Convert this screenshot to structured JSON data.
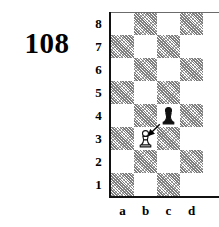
{
  "problem": {
    "number": "108"
  },
  "board": {
    "files": [
      "a",
      "b",
      "c",
      "d"
    ],
    "ranks": [
      "8",
      "7",
      "6",
      "5",
      "4",
      "3",
      "2",
      "1"
    ],
    "light_color": "#ffffff",
    "dark_color": "#8c8c8c",
    "border_color": "#111111",
    "squares": [
      {
        "file": "a",
        "rank": "8",
        "shade": "light"
      },
      {
        "file": "b",
        "rank": "8",
        "shade": "dark"
      },
      {
        "file": "c",
        "rank": "8",
        "shade": "light"
      },
      {
        "file": "d",
        "rank": "8",
        "shade": "dark"
      },
      {
        "file": "a",
        "rank": "7",
        "shade": "dark"
      },
      {
        "file": "b",
        "rank": "7",
        "shade": "light"
      },
      {
        "file": "c",
        "rank": "7",
        "shade": "dark"
      },
      {
        "file": "d",
        "rank": "7",
        "shade": "light"
      },
      {
        "file": "a",
        "rank": "6",
        "shade": "light"
      },
      {
        "file": "b",
        "rank": "6",
        "shade": "dark"
      },
      {
        "file": "c",
        "rank": "6",
        "shade": "light"
      },
      {
        "file": "d",
        "rank": "6",
        "shade": "dark"
      },
      {
        "file": "a",
        "rank": "5",
        "shade": "dark"
      },
      {
        "file": "b",
        "rank": "5",
        "shade": "light"
      },
      {
        "file": "c",
        "rank": "5",
        "shade": "dark"
      },
      {
        "file": "d",
        "rank": "5",
        "shade": "light"
      },
      {
        "file": "a",
        "rank": "4",
        "shade": "light"
      },
      {
        "file": "b",
        "rank": "4",
        "shade": "dark"
      },
      {
        "file": "c",
        "rank": "4",
        "shade": "light"
      },
      {
        "file": "d",
        "rank": "4",
        "shade": "dark"
      },
      {
        "file": "a",
        "rank": "3",
        "shade": "dark"
      },
      {
        "file": "b",
        "rank": "3",
        "shade": "light"
      },
      {
        "file": "c",
        "rank": "3",
        "shade": "dark"
      },
      {
        "file": "d",
        "rank": "3",
        "shade": "light"
      },
      {
        "file": "a",
        "rank": "2",
        "shade": "light"
      },
      {
        "file": "b",
        "rank": "2",
        "shade": "dark"
      },
      {
        "file": "c",
        "rank": "2",
        "shade": "light"
      },
      {
        "file": "d",
        "rank": "2",
        "shade": "dark"
      },
      {
        "file": "a",
        "rank": "1",
        "shade": "dark"
      },
      {
        "file": "b",
        "rank": "1",
        "shade": "light"
      },
      {
        "file": "c",
        "rank": "1",
        "shade": "dark"
      },
      {
        "file": "d",
        "rank": "1",
        "shade": "light"
      }
    ],
    "pieces": [
      {
        "id": "white-pawn-b3",
        "color": "white",
        "type": "pawn",
        "square": "b3",
        "file": "b",
        "rank": "3"
      },
      {
        "id": "black-pawn-c4",
        "color": "black",
        "type": "pawn",
        "square": "c4",
        "file": "c",
        "rank": "4"
      }
    ],
    "arrow": {
      "id": "move-arrow-b3-c4",
      "from": "b3",
      "to": "c4",
      "color": "#000000"
    }
  }
}
